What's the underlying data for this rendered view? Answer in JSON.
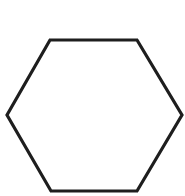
{
  "diagram": {
    "shape": "hexagon",
    "orientation": "flat-top",
    "stroke_color": "#1e1e1e",
    "fill_color": "#ffffff",
    "background_color": "#ffffff",
    "stroke_width": 3.2,
    "points": "50,40 137,40 182,115 137,191 51,191 7,115"
  }
}
